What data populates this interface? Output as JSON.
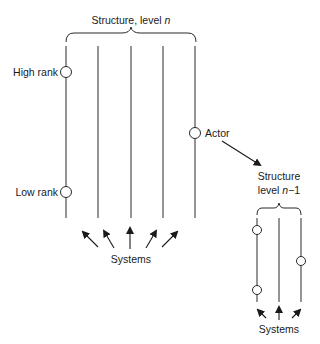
{
  "diagram": {
    "main_structure": {
      "title": "Structure, level ",
      "title_var": "n",
      "lines": 5,
      "labels": {
        "high_rank": "High rank",
        "low_rank": "Low rank",
        "actor": "Actor"
      },
      "systems_label": "Systems",
      "arrows": 5
    },
    "sub_structure": {
      "title_line1": "Structure",
      "title_line2_prefix": "level ",
      "title_var": "n",
      "title_suffix": "−1",
      "lines": 3,
      "nodes": 3,
      "systems_label": "Systems",
      "arrows": 3
    },
    "colors": {
      "stroke": "#2a2a2a",
      "text": "#1a1a1a",
      "background": "#ffffff"
    }
  }
}
